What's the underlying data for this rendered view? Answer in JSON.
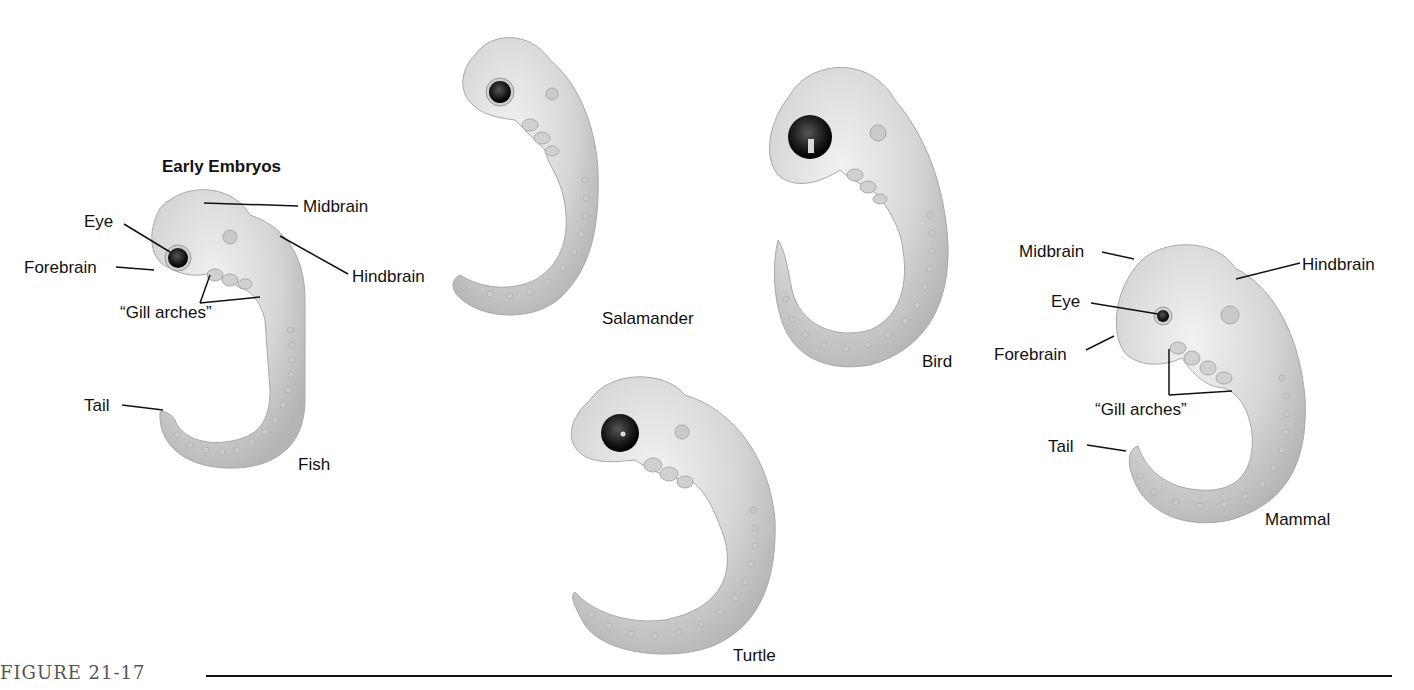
{
  "figure": {
    "caption": "FIGURE 21-17",
    "heading": "Early Embryos"
  },
  "embryos": {
    "fish": {
      "name": "Fish",
      "labels": {
        "eye": "Eye",
        "forebrain": "Forebrain",
        "midbrain": "Midbrain",
        "hindbrain": "Hindbrain",
        "gill_arches": "“Gill arches”",
        "tail": "Tail"
      }
    },
    "salamander": {
      "name": "Salamander"
    },
    "bird": {
      "name": "Bird"
    },
    "turtle": {
      "name": "Turtle"
    },
    "mammal": {
      "name": "Mammal",
      "labels": {
        "midbrain": "Midbrain",
        "hindbrain": "Hindbrain",
        "eye": "Eye",
        "forebrain": "Forebrain",
        "gill_arches": "“Gill arches”",
        "tail": "Tail"
      }
    }
  },
  "colors": {
    "body_fill": "#d9d9d9",
    "body_shade": "#b8b8b8",
    "eye": "#1a1a1a",
    "text": "#111111",
    "caption": "#555555"
  }
}
